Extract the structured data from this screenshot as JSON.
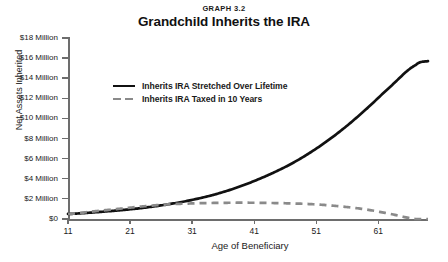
{
  "header": {
    "graph_label": "GRAPH 3.2",
    "title": "Grandchild Inherits the IRA"
  },
  "axes": {
    "ylabel": "Net Assets Inherited",
    "xlabel": "Age of Beneficiary",
    "yticks": [
      "$0",
      "$2 Million",
      "$4 Million",
      "$6 Million",
      "$8 Million",
      "$10 Million",
      "$12 Million",
      "$14 Million",
      "$16 Million",
      "$18 Million"
    ],
    "xticks": [
      "11",
      "21",
      "31",
      "41",
      "51",
      "61"
    ]
  },
  "legend": [
    {
      "label": "Inherits IRA Stretched Over Lifetime",
      "style": "solid",
      "color": "#111111"
    },
    {
      "label": "Inherits IRA Taxed in 10 Years",
      "style": "dashed",
      "color": "#8a8a8a"
    }
  ],
  "colors": {
    "stretched": "#111111",
    "taxed": "#8a8a8a",
    "axis": "#6d6d6d",
    "text": "#1a1a1a",
    "background": "#ffffff"
  },
  "chart_data": {
    "type": "line",
    "title": "Grandchild Inherits the IRA",
    "subtitle": "GRAPH 3.2",
    "xlabel": "Age of Beneficiary",
    "ylabel": "Net Assets Inherited",
    "xlim": [
      11,
      69
    ],
    "ylim": [
      0,
      18
    ],
    "y_unit": "Million USD",
    "y_tick_values": [
      0,
      2,
      4,
      6,
      8,
      10,
      12,
      14,
      16,
      18
    ],
    "x_tick_values": [
      11,
      21,
      31,
      41,
      51,
      61
    ],
    "grid": false,
    "legend_position": "upper-left-inside",
    "x": [
      11,
      15,
      19,
      23,
      27,
      31,
      35,
      39,
      43,
      47,
      51,
      55,
      59,
      63,
      67,
      69
    ],
    "series": [
      {
        "name": "Inherits IRA Stretched Over Lifetime",
        "style": "solid",
        "color": "#111111",
        "values": [
          0.5,
          0.65,
          0.85,
          1.1,
          1.45,
          1.9,
          2.5,
          3.3,
          4.3,
          5.5,
          7.0,
          8.8,
          10.9,
          13.2,
          15.3,
          15.7
        ]
      },
      {
        "name": "Inherits IRA Taxed in 10 Years",
        "style": "dashed",
        "color": "#8a8a8a",
        "values": [
          0.5,
          0.75,
          1.0,
          1.25,
          1.45,
          1.55,
          1.6,
          1.62,
          1.6,
          1.55,
          1.45,
          1.25,
          0.95,
          0.5,
          0.0,
          0.0
        ]
      }
    ]
  }
}
